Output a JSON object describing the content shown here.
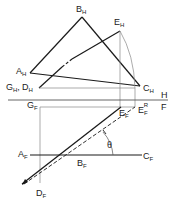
{
  "diagram": {
    "fold_line": {
      "upper_label": "H",
      "lower_label": "F"
    },
    "top_view_labels": {
      "B": {
        "main": "B",
        "sub": "H"
      },
      "E": {
        "main": "E",
        "sub": "H"
      },
      "A": {
        "main": "A",
        "sub": "H"
      },
      "GD": {
        "main1": "G",
        "sub1": "H",
        "sep": ",",
        "main2": "D",
        "sub2": "H"
      },
      "C": {
        "main": "C",
        "sub": "H"
      }
    },
    "front_view_labels": {
      "G": {
        "main": "G",
        "sub": "F"
      },
      "E": {
        "main": "E",
        "sub": "F"
      },
      "ER": {
        "main": "E",
        "sub": "F",
        "sup": "R"
      },
      "A": {
        "main": "A",
        "sub": "F"
      },
      "B": {
        "main": "B",
        "sub": "F"
      },
      "C": {
        "main": "C",
        "sub": "F"
      },
      "D": {
        "main": "D",
        "sub": "F"
      }
    },
    "angle_label": "θ",
    "colors": {
      "line": "#1a1a1a",
      "construction": "#888888"
    }
  }
}
